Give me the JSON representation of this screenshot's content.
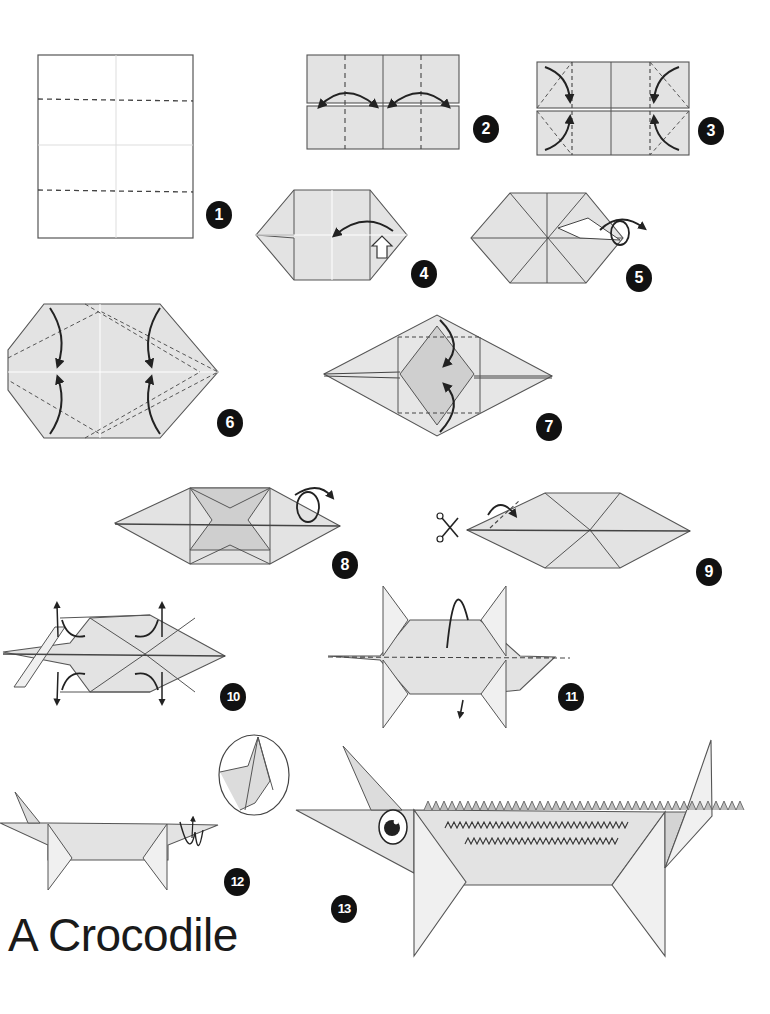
{
  "title": "A Crocodile",
  "colors": {
    "paper": "#e3e3e3",
    "paper_light": "#efefef",
    "paper_dark": "#cfcfcf",
    "line": "#444444",
    "badge": "#111111",
    "badge_text": "#ffffff"
  },
  "steps": [
    {
      "number": "1",
      "description": "Sheet with two horizontal valley-fold lines"
    },
    {
      "number": "2",
      "description": "Fold sides to the center crease"
    },
    {
      "number": "3",
      "description": "Fold the four corners inward"
    },
    {
      "number": "4",
      "description": "Open and squash fold"
    },
    {
      "number": "5",
      "description": "Fold flap and turn over"
    },
    {
      "number": "6",
      "description": "Fold along diagonal dashed lines"
    },
    {
      "number": "7",
      "description": "Fold top and bottom points to center"
    },
    {
      "number": "8",
      "description": "Turn the model over"
    },
    {
      "number": "9",
      "description": "Cut along the line and fold the flap",
      "icon": "scissors-icon"
    },
    {
      "number": "10",
      "description": "Pull out the four legs"
    },
    {
      "number": "11",
      "description": "Fold the model in half"
    },
    {
      "number": "12",
      "description": "Shape the head with a crimp fold"
    },
    {
      "number": "13",
      "description": "Finished crocodile"
    }
  ]
}
